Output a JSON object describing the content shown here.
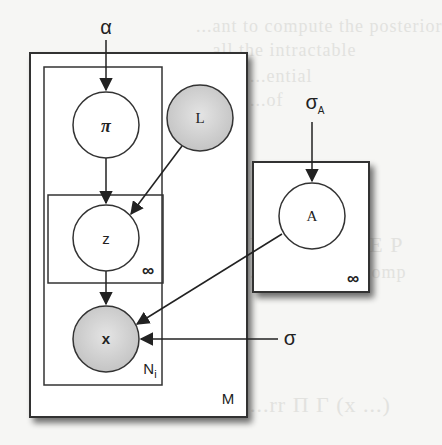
{
  "diagram": {
    "type": "plate-notation graphical model",
    "nodes": [
      {
        "id": "alpha",
        "label": "α",
        "kind": "hyperparameter"
      },
      {
        "id": "pi",
        "label": "π",
        "kind": "latent"
      },
      {
        "id": "L",
        "label": "L",
        "kind": "observed"
      },
      {
        "id": "z",
        "label": "z",
        "kind": "latent"
      },
      {
        "id": "x",
        "label": "x",
        "kind": "observed"
      },
      {
        "id": "A",
        "label": "A",
        "kind": "latent"
      },
      {
        "id": "sigma_A",
        "label": "σ",
        "subscript": "A",
        "kind": "hyperparameter"
      },
      {
        "id": "sigma",
        "label": "σ",
        "kind": "hyperparameter"
      }
    ],
    "edges": [
      {
        "from": "alpha",
        "to": "pi"
      },
      {
        "from": "pi",
        "to": "z"
      },
      {
        "from": "L",
        "to": "z"
      },
      {
        "from": "z",
        "to": "x"
      },
      {
        "from": "A",
        "to": "x"
      },
      {
        "from": "sigma",
        "to": "x"
      },
      {
        "from": "sigma_A",
        "to": "A"
      }
    ],
    "plates": [
      {
        "id": "M",
        "label": "M"
      },
      {
        "id": "Ni",
        "label": "N",
        "subscript": "i"
      },
      {
        "id": "inf_z",
        "label": "∞"
      },
      {
        "id": "inf_A",
        "label": "∞"
      }
    ]
  },
  "background_text": [
    "...ant to compute the posterior",
    "...all the intractable",
    "...ential",
    "...of",
    "V  e  c  o  r  r  l  E  P",
    "...hed just precomp",
    "...rr   Π  Γ  (x  ...)"
  ]
}
